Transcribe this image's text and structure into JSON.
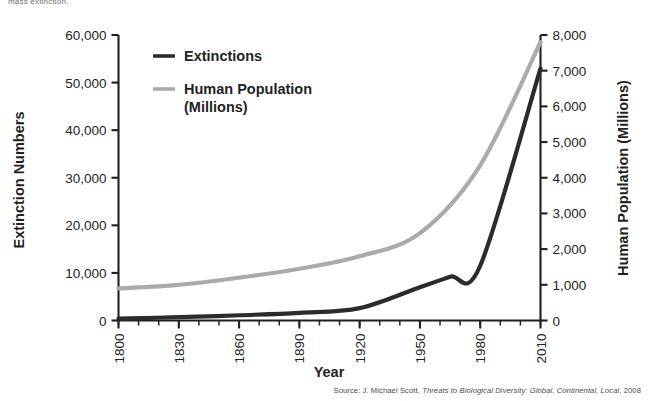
{
  "page": {
    "cut_off_caption": "mass extinction."
  },
  "chart_data": {
    "type": "line",
    "title": "",
    "xlabel": "Year",
    "ylabel": "Extinction Numbers",
    "y2label": "Human Population (Millions)",
    "x": [
      1800,
      1830,
      1860,
      1890,
      1920,
      1950,
      1980,
      2010
    ],
    "xlim": [
      1800,
      2010
    ],
    "xticks": [
      1800,
      1830,
      1860,
      1890,
      1920,
      1950,
      1980,
      2010
    ],
    "xticklabels": [
      "1800",
      "1830",
      "1860",
      "1890",
      "1920",
      "1950",
      "1980",
      "2010"
    ],
    "x_minor_step": 10,
    "ylim": [
      0,
      60000
    ],
    "yticks": [
      0,
      10000,
      20000,
      30000,
      40000,
      50000,
      60000
    ],
    "yticklabels": [
      "0",
      "10,000",
      "20,000",
      "30,000",
      "40,000",
      "50,000",
      "60,000"
    ],
    "y2lim": [
      0,
      8000
    ],
    "y2ticks": [
      0,
      1000,
      2000,
      3000,
      4000,
      5000,
      6000,
      7000,
      8000
    ],
    "y2ticklabels": [
      "0",
      "1,000",
      "2,000",
      "3,000",
      "4,000",
      "5,000",
      "6,000",
      "7,000",
      "8,000"
    ],
    "grid": false,
    "legend_position": "upper-left-inside",
    "series": [
      {
        "name": "Extinctions",
        "axis": "left",
        "color": "#2b2b2b",
        "x": [
          1800,
          1830,
          1860,
          1890,
          1920,
          1950,
          1965,
          1980,
          2010
        ],
        "values": [
          400,
          700,
          1100,
          1600,
          2600,
          7000,
          9200,
          11500,
          53000
        ]
      },
      {
        "name": "Human Population (Millions)",
        "axis": "right",
        "color": "#aaaaaa",
        "x": [
          1800,
          1830,
          1860,
          1890,
          1920,
          1950,
          1980,
          2010
        ],
        "values": [
          900,
          1000,
          1200,
          1450,
          1800,
          2450,
          4350,
          7800
        ]
      }
    ],
    "legend": [
      {
        "label": "Extinctions",
        "color": "#2b2b2b"
      },
      {
        "label": "Human Population",
        "color": "#aaaaaa"
      },
      {
        "label": "(Millions)",
        "color": "#aaaaaa"
      }
    ],
    "source": {
      "prefix": "Source: J. Michael Scott, ",
      "work": "Threats to Biological Diversity: Global, Continental, Local",
      "suffix": ", 2008"
    }
  }
}
